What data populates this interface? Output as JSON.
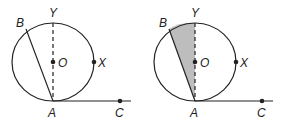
{
  "figures": [
    {
      "id": "left",
      "shaded": false,
      "labels": {
        "B": "B",
        "Y": "Y",
        "O": "O",
        "X": "X",
        "A": "A",
        "C": "C"
      }
    },
    {
      "id": "right",
      "shaded": true,
      "labels": {
        "B": "B",
        "Y": "Y",
        "O": "O",
        "X": "X",
        "A": "A",
        "C": "C"
      }
    }
  ],
  "colors": {
    "stroke": "#222222",
    "shade": "#bdbdbd"
  }
}
